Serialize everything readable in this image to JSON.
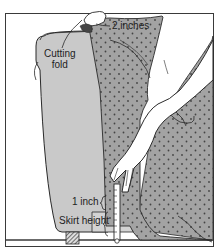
{
  "figure": {
    "type": "instructional-illustration"
  },
  "labels": {
    "cutting_fold_line1": "Cutting",
    "cutting_fold_line2": "fold",
    "two_inches": "2 inches",
    "one_inch": "1 inch",
    "skirt_height": "Skirt height"
  },
  "colors": {
    "frame": "#3a3a3a",
    "chair_fill": "#c9c9c9",
    "fabric_fill": "#9c9c9c",
    "fabric_dot": "#4a4a4a",
    "hand_fill": "#ffffff",
    "line": "#2a2a2a",
    "floor_shadow": "#b8b8b8"
  }
}
